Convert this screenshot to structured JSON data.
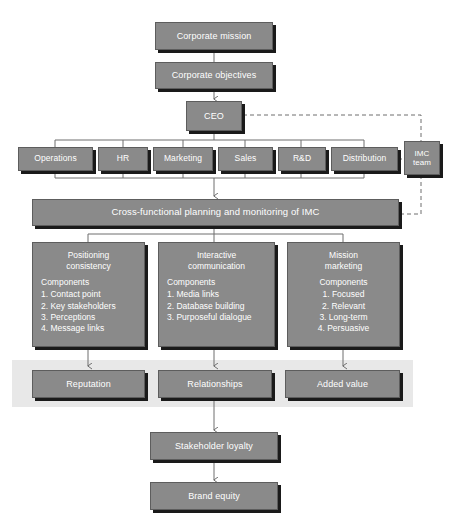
{
  "diagram": {
    "colors": {
      "node_fill": "#8a8a8a",
      "node_border": "#5d5d5d",
      "node_shadow": "#1a1a1a",
      "node_text": "#ffffff",
      "band_fill": "#e8e8e8",
      "connector": "#6f6f6f",
      "background": "#ffffff"
    },
    "top_chain": [
      {
        "id": "corporate-mission",
        "label": "Corporate mission"
      },
      {
        "id": "corporate-objectives",
        "label": "Corporate objectives"
      },
      {
        "id": "ceo",
        "label": "CEO"
      }
    ],
    "imc_team": {
      "id": "imc-team",
      "label": "IMC\nteam",
      "line1": "IMC",
      "line2": "team"
    },
    "departments": [
      {
        "id": "operations",
        "label": "Operations"
      },
      {
        "id": "hr",
        "label": "HR"
      },
      {
        "id": "marketing",
        "label": "Marketing"
      },
      {
        "id": "sales",
        "label": "Sales"
      },
      {
        "id": "rd",
        "label": "R&D"
      },
      {
        "id": "distribution",
        "label": "Distribution"
      }
    ],
    "planning_bar": {
      "id": "cross-functional-planning",
      "label": "Cross-functional planning and monitoring of IMC"
    },
    "pillars": [
      {
        "id": "positioning-consistency",
        "title": "Positioning\nconsistency",
        "components_label": "Components",
        "components": [
          "1. Contact point",
          "2. Key stakeholders",
          "3. Perceptions",
          "4. Message links"
        ]
      },
      {
        "id": "interactive-communication",
        "title": "Interactive\ncommunication",
        "components_label": "Components",
        "components": [
          "1. Media links",
          "2. Database building",
          "3. Purposeful dialogue"
        ]
      },
      {
        "id": "mission-marketing",
        "title": "Mission\nmarketing",
        "components_label": "Components",
        "components": [
          "1. Focused",
          "2. Relevant",
          "3. Long-term",
          "4. Persuasive"
        ]
      }
    ],
    "outcomes": [
      {
        "id": "reputation",
        "label": "Reputation"
      },
      {
        "id": "relationships",
        "label": "Relationships"
      },
      {
        "id": "added-value",
        "label": "Added value"
      }
    ],
    "bottom_chain": [
      {
        "id": "stakeholder-loyalty",
        "label": "Stakeholder loyalty"
      },
      {
        "id": "brand-equity",
        "label": "Brand equity"
      }
    ]
  }
}
